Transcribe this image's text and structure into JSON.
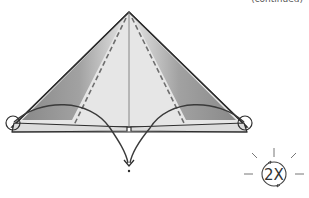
{
  "header": {
    "continued_label": "(continued)"
  },
  "diagram": {
    "type": "origami-step",
    "shape": "triangle",
    "fold_lines": [
      "valley-fold-dashed-left",
      "valley-fold-dashed-right"
    ],
    "markers": [
      "circle-left-corner",
      "circle-right-corner"
    ],
    "arrows": [
      "fold-arrow-left",
      "fold-arrow-right"
    ],
    "colors": {
      "outline": "#333333",
      "paper_light": "#e6e6e6",
      "paper_shade": "#8a8a8a",
      "dash": "#6e6e6e"
    }
  },
  "repeat_symbol": {
    "label": "2X",
    "icon": "repeat-icon"
  }
}
